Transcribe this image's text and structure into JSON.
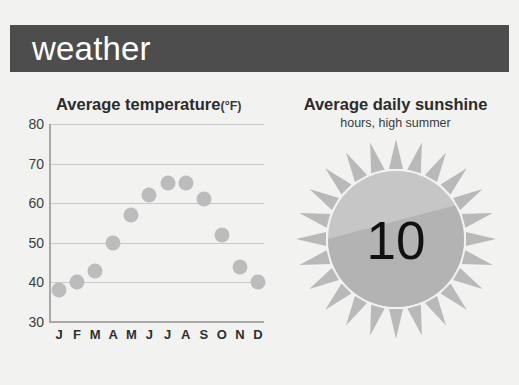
{
  "header": {
    "title": "weather",
    "bar_color": "#4d4d4d",
    "text_color": "#ffffff"
  },
  "page": {
    "background": "#f2f2f0"
  },
  "temperature_panel": {
    "title": "Average temperature",
    "unit": "(°F)"
  },
  "sunshine_panel": {
    "title": "Average daily sunshine",
    "subtitle": "hours, high summer",
    "value": "10",
    "ray_count": 24,
    "disc_color_light": "#c6c6c6",
    "disc_color_dark": "#b3b3b3",
    "ray_color": "#b9b9b9"
  },
  "chart_data": [
    {
      "type": "scatter",
      "title": "Average temperature (°F)",
      "xlabel": "",
      "ylabel": "",
      "ylim": [
        30,
        80
      ],
      "yticks": [
        80,
        70,
        60,
        50,
        40,
        30
      ],
      "grid": true,
      "legend": "none",
      "marker_color": "#bcbcbc",
      "categories": [
        "J",
        "F",
        "M",
        "A",
        "M",
        "J",
        "J",
        "A",
        "S",
        "O",
        "N",
        "D"
      ],
      "category_names": [
        "January",
        "February",
        "March",
        "April",
        "May",
        "June",
        "July",
        "August",
        "September",
        "October",
        "November",
        "December"
      ],
      "values": [
        38,
        40,
        43,
        50,
        57,
        62,
        65,
        65,
        61,
        52,
        44,
        40
      ]
    },
    {
      "type": "pie",
      "title": "Average daily sunshine",
      "subtitle": "hours, high summer",
      "values": [
        10,
        14
      ],
      "labels": [
        "sunshine hours",
        "remaining hours"
      ],
      "center_label": "10",
      "ylim": [
        0,
        24
      ]
    }
  ]
}
